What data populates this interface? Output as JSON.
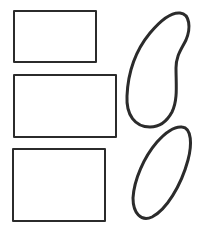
{
  "canvas": {
    "width": 201,
    "height": 237,
    "background": "#ffffff"
  },
  "style": {
    "stroke_color": "#2b2b2b",
    "rect_stroke_width": 2,
    "blob_stroke_width": 3
  },
  "shapes": {
    "rectangles": [
      {
        "name": "rectangle-top",
        "x": 14,
        "y": 11,
        "width": 82,
        "height": 51
      },
      {
        "name": "rectangle-middle",
        "x": 14,
        "y": 75,
        "width": 102,
        "height": 62
      },
      {
        "name": "rectangle-bottom",
        "x": 13,
        "y": 149,
        "width": 92,
        "height": 72
      }
    ],
    "blobs": [
      {
        "name": "bean-shape",
        "path": "M 180 13 C 190 14 191 28 186 40 C 181 50 176 56 176 68 C 176 84 178 100 172 112 C 166 123 158 127 150 127 C 135 127 126 115 127 96 C 128 72 136 50 150 33 C 160 21 170 12 180 13 Z"
      },
      {
        "name": "ellipse-shape",
        "path": "M 182 127 C 192 128 192 145 188 160 C 181 186 166 210 152 217 C 141 222 133 213 133 198 C 134 180 144 157 157 142 C 165 133 174 126 182 127 Z"
      }
    ]
  }
}
